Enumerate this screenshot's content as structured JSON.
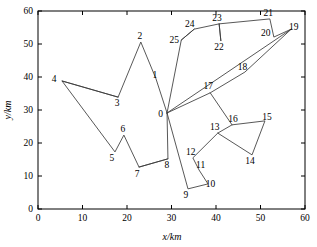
{
  "chart_data": {
    "type": "scatter",
    "title": "",
    "xlabel": "x/km",
    "ylabel": "y/km",
    "xlim": [
      0,
      60
    ],
    "ylim": [
      0,
      60
    ],
    "xticks": [
      0,
      10,
      20,
      30,
      40,
      50,
      60
    ],
    "yticks": [
      0,
      10,
      20,
      30,
      40,
      50,
      60
    ],
    "xtick_labels": [
      "0",
      "10",
      "20",
      "30",
      "40",
      "50",
      "60"
    ],
    "ytick_labels": [
      "0",
      "10",
      "20",
      "30",
      "40",
      "50",
      "60"
    ],
    "grid": false,
    "legend": false,
    "point_labels": [
      "0",
      "1",
      "2",
      "3",
      "4",
      "5",
      "6",
      "7",
      "8",
      "9",
      "10",
      "11",
      "12",
      "13",
      "14",
      "15",
      "16",
      "17",
      "18",
      "19",
      "20",
      "21",
      "22",
      "23",
      "24",
      "25"
    ],
    "points": [
      {
        "id": "0",
        "x": 29.0,
        "y": 29.1,
        "label_dx": -6.5,
        "label_dy": 4.0
      },
      {
        "id": "1",
        "x": 26.5,
        "y": 39.5,
        "label_dx": -1.0,
        "label_dy": -1.0
      },
      {
        "id": "2",
        "x": 23.1,
        "y": 50.6,
        "label_dx": -1.0,
        "label_dy": -3.5
      },
      {
        "id": "3",
        "x": 18.0,
        "y": 33.9,
        "label_dx": -1.0,
        "label_dy": 9.0
      },
      {
        "id": "4",
        "x": 5.4,
        "y": 38.8,
        "label_dx": -8.0,
        "label_dy": 1.5
      },
      {
        "id": "5",
        "x": 17.3,
        "y": 17.3,
        "label_dx": -3.0,
        "label_dy": 9.0
      },
      {
        "id": "6",
        "x": 19.3,
        "y": 22.4,
        "label_dx": -1.0,
        "label_dy": -3.0
      },
      {
        "id": "7",
        "x": 22.7,
        "y": 12.7,
        "label_dx": -2.0,
        "label_dy": 9.5
      },
      {
        "id": "8",
        "x": 29.2,
        "y": 15.2,
        "label_dx": -1.0,
        "label_dy": 9.0
      },
      {
        "id": "9",
        "x": 33.7,
        "y": 6.1,
        "label_dx": -2.0,
        "label_dy": 9.5
      },
      {
        "id": "10",
        "x": 38.2,
        "y": 7.6,
        "label_dx": 2.5,
        "label_dy": 3.5
      },
      {
        "id": "11",
        "x": 36.2,
        "y": 11.8,
        "label_dx": 1.5,
        "label_dy": -2.0
      },
      {
        "id": "12",
        "x": 34.8,
        "y": 15.5,
        "label_dx": -2.0,
        "label_dy": -3.0
      },
      {
        "id": "13",
        "x": 40.4,
        "y": 23.0,
        "label_dx": -3.0,
        "label_dy": -3.5
      },
      {
        "id": "14",
        "x": 48.1,
        "y": 16.4,
        "label_dx": -2.0,
        "label_dy": 9.0
      },
      {
        "id": "15",
        "x": 51.0,
        "y": 26.7,
        "label_dx": 2.0,
        "label_dy": -1.0
      },
      {
        "id": "16",
        "x": 43.6,
        "y": 25.5,
        "label_dx": 1.0,
        "label_dy": -2.5
      },
      {
        "id": "17",
        "x": 38.7,
        "y": 35.2,
        "label_dx": -2.0,
        "label_dy": -3.5
      },
      {
        "id": "18",
        "x": 46.5,
        "y": 41.5,
        "label_dx": -2.5,
        "label_dy": -2.5
      },
      {
        "id": "19",
        "x": 56.9,
        "y": 54.5,
        "label_dx": 2.5,
        "label_dy": 0.5
      },
      {
        "id": "20",
        "x": 53.0,
        "y": 52.1,
        "label_dx": -8.0,
        "label_dy": -1.5
      },
      {
        "id": "21",
        "x": 52.1,
        "y": 57.6,
        "label_dx": -1.5,
        "label_dy": -3.0
      },
      {
        "id": "22",
        "x": 41.1,
        "y": 50.9,
        "label_dx": -2.0,
        "label_dy": 8.5
      },
      {
        "id": "23",
        "x": 40.7,
        "y": 56.1,
        "label_dx": -2.0,
        "label_dy": -3.0
      },
      {
        "id": "24",
        "x": 35.1,
        "y": 54.5,
        "label_dx": -4.5,
        "label_dy": -2.5
      },
      {
        "id": "25",
        "x": 32.2,
        "y": 51.2,
        "label_dx": -7.0,
        "label_dy": 2.5
      }
    ],
    "routes": [
      {
        "name": "route-west",
        "nodes": [
          "0",
          "1",
          "2",
          "3",
          "4",
          "5",
          "6",
          "7",
          "8",
          "0"
        ]
      },
      {
        "name": "route-south",
        "nodes": [
          "0",
          "9",
          "10",
          "11",
          "12",
          "13",
          "16",
          "15",
          "14",
          "13"
        ]
      },
      {
        "name": "route-east",
        "nodes": [
          "0",
          "17",
          "18",
          "19",
          "20",
          "21",
          "23",
          "22",
          "23"
        ]
      },
      {
        "name": "route-north",
        "nodes": [
          "0",
          "25",
          "24",
          "23"
        ]
      },
      {
        "name": "route-spur-17-16",
        "nodes": [
          "17",
          "16"
        ]
      },
      {
        "name": "route-spur-0-19",
        "nodes": [
          "0",
          "19"
        ]
      },
      {
        "name": "route-spur-24-25",
        "nodes": [
          "24",
          "25"
        ]
      },
      {
        "name": "route-spur-4-3",
        "nodes": [
          "4",
          "3"
        ]
      },
      {
        "name": "route-spur-7-8",
        "nodes": [
          "7",
          "8"
        ]
      }
    ]
  }
}
